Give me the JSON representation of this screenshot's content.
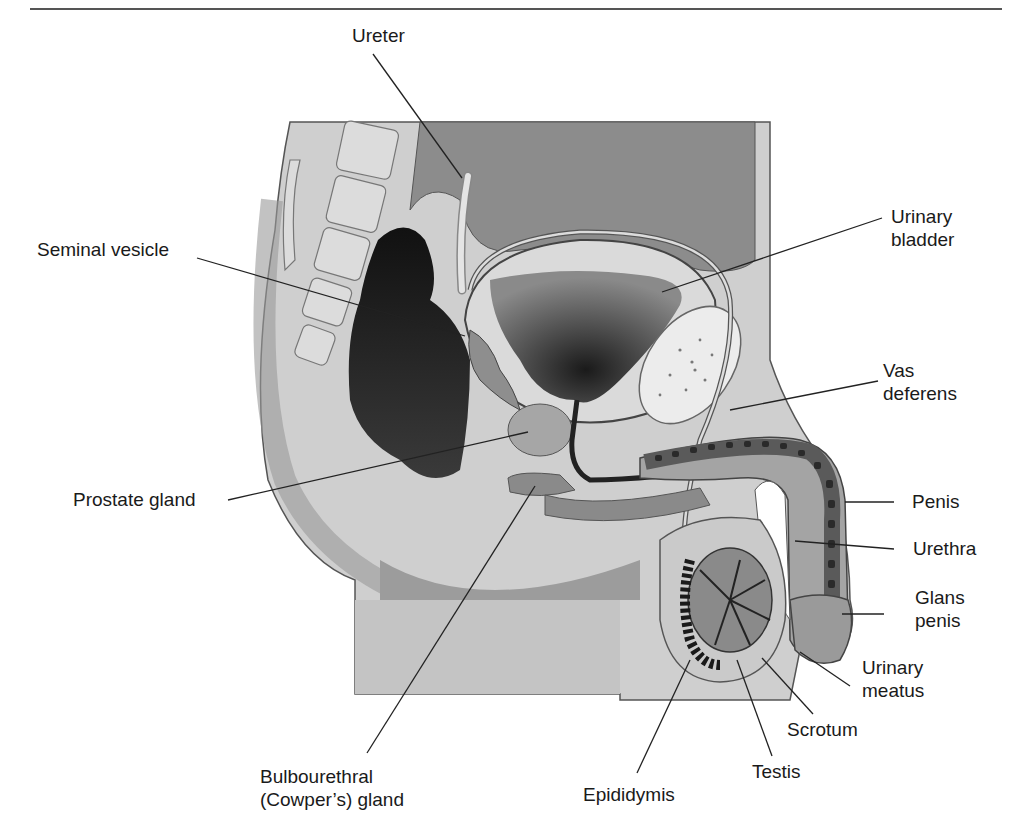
{
  "figure": {
    "labels": [
      {
        "id": "ureter",
        "text": "Ureter"
      },
      {
        "id": "urinary-bladder",
        "text": "Urinary bladder",
        "lines": [
          "Urinary",
          "bladder"
        ]
      },
      {
        "id": "seminal-vesicle",
        "text": "Seminal vesicle"
      },
      {
        "id": "vas-deferens",
        "text": "Vas deferens",
        "lines": [
          "Vas",
          "deferens"
        ]
      },
      {
        "id": "prostate-gland",
        "text": "Prostate gland"
      },
      {
        "id": "penis",
        "text": "Penis"
      },
      {
        "id": "urethra",
        "text": "Urethra"
      },
      {
        "id": "glans-penis",
        "text": "Glans penis",
        "lines": [
          "Glans",
          "penis"
        ]
      },
      {
        "id": "urinary-meatus",
        "text": "Urinary meatus",
        "lines": [
          "Urinary",
          "meatus"
        ]
      },
      {
        "id": "scrotum",
        "text": "Scrotum"
      },
      {
        "id": "testis",
        "text": "Testis"
      },
      {
        "id": "epididymis",
        "text": "Epididymis"
      },
      {
        "id": "bulbourethral-gland",
        "text": "Bulbourethral (Cowper's) gland",
        "lines": [
          "Bulbourethral",
          "(Cowper’s) gland"
        ]
      }
    ]
  },
  "colors": {
    "background": "#ffffff",
    "tissue_light": "#d2d2d2",
    "tissue_mid": "#a8a8a8",
    "tissue_dark": "#6e6e6e",
    "cavity_dark": "#1e1e1e",
    "leader_line": "#222222"
  }
}
